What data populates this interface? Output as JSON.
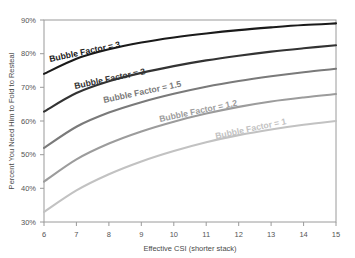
{
  "title_remnant": "",
  "axes": {
    "x_label": "Effective CSI (shorter stack)",
    "y_label": "Percent You Need Him to Fold to Resteal",
    "x_ticks": [
      "6",
      "7",
      "8",
      "9",
      "10",
      "11",
      "12",
      "13",
      "14",
      "15"
    ],
    "y_ticks": [
      "90%",
      "80%",
      "70%",
      "60%",
      "50%",
      "40%",
      "30%"
    ]
  },
  "series_labels": {
    "bf3": "Bubble Factor = 3",
    "bf2": "Bubble Factor = 2",
    "bf15": "Bubble Factor = 1.5",
    "bf12": "Bubble Factor = 1.2",
    "bf1": "Bubble Factor = 1"
  },
  "chart_data": {
    "type": "line",
    "title": "",
    "xlabel": "Effective CSI (shorter stack)",
    "ylabel": "Percent You Need Him to Fold to Resteal",
    "xlim": [
      6,
      15
    ],
    "ylim": [
      30,
      90
    ],
    "grid": false,
    "legend": "inline-curve-labels",
    "x": [
      6,
      7,
      8,
      9,
      10,
      11,
      12,
      13,
      14,
      15
    ],
    "series": [
      {
        "name": "Bubble Factor = 3",
        "color": "#1a1a1a",
        "values": [
          74.0,
          78.5,
          81.3,
          83.3,
          84.8,
          86.0,
          87.0,
          87.8,
          88.5,
          89.0
        ]
      },
      {
        "name": "Bubble Factor = 2",
        "color": "#333333",
        "values": [
          62.8,
          68.3,
          71.8,
          74.3,
          76.3,
          78.0,
          79.4,
          80.6,
          81.6,
          82.5
        ]
      },
      {
        "name": "Bubble Factor = 1.5",
        "color": "#7a7a7a",
        "values": [
          52.0,
          58.3,
          62.5,
          65.6,
          68.1,
          70.2,
          71.9,
          73.3,
          74.5,
          75.5
        ]
      },
      {
        "name": "Bubble Factor = 1.2",
        "color": "#9c9c9c",
        "values": [
          42.0,
          48.6,
          53.3,
          56.9,
          59.8,
          62.2,
          64.2,
          65.8,
          67.0,
          68.0
        ]
      },
      {
        "name": "Bubble Factor = 1",
        "color": "#c2c2c2",
        "values": [
          33.0,
          39.4,
          44.2,
          48.0,
          51.1,
          53.7,
          55.8,
          57.5,
          58.9,
          60.0
        ]
      }
    ]
  }
}
